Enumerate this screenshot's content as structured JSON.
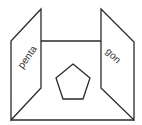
{
  "diagram": {
    "type": "folded-card-pentagon",
    "left_panel": {
      "label": "penta"
    },
    "right_panel": {
      "label": "gon"
    },
    "center_shape": "pentagon"
  }
}
